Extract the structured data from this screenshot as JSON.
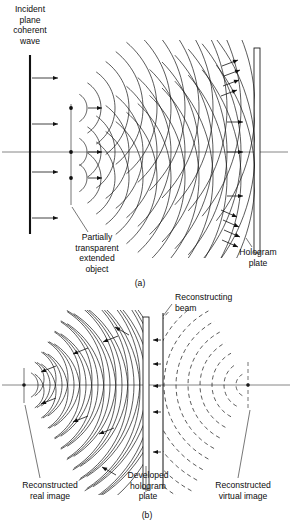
{
  "figure": {
    "title_visible": false,
    "width": 294,
    "height": 528,
    "background": "#ffffff",
    "ink": "#111111"
  },
  "panel_a": {
    "id_label": "(a)",
    "id_pos": {
      "x": 140,
      "y": 286
    },
    "labels": {
      "incident_wave": {
        "lines": [
          "Incident",
          "plane",
          "coherent",
          "wave"
        ],
        "x": 30,
        "y": 12,
        "align": "middle"
      },
      "object": {
        "lines": [
          "Partially",
          "transparent",
          "extended",
          "object"
        ],
        "x": 97,
        "y": 240,
        "align": "middle"
      },
      "hologram_plate": {
        "lines": [
          "Hologram",
          "plate"
        ],
        "x": 258,
        "y": 255,
        "align": "middle"
      }
    },
    "incident_beam": {
      "x": 30,
      "y_top": 55,
      "y_bottom": 234,
      "arrow_y": [
        78,
        124,
        172,
        218
      ],
      "arrow_len": 26
    },
    "optical_axis": {
      "x1": 2,
      "x2": 288,
      "y": 152
    },
    "object_line": {
      "x": 71,
      "y_top": 104,
      "y_bottom": 205
    },
    "object_points": [
      {
        "x": 71,
        "y": 108
      },
      {
        "x": 71,
        "y": 152
      },
      {
        "x": 71,
        "y": 178
      }
    ],
    "hologram_plate_rect": {
      "x": 254,
      "y": 48,
      "w": 6,
      "h": 205
    },
    "wavefront_count_per_source": 13,
    "wave_spacing": 14,
    "wave_start_radius": 16,
    "propagation_arrows": 14,
    "leader_object": {
      "x1": 88,
      "y1": 232,
      "x2": 72,
      "y2": 207
    },
    "leader_plate": {
      "x1": 252,
      "y1": 247,
      "x2": 246,
      "y2": 238
    }
  },
  "panel_b": {
    "id_label": "(b)",
    "id_pos": {
      "x": 147,
      "y": 518
    },
    "labels": {
      "reconstructing_beam": {
        "lines": [
          "Reconstructing",
          "beam"
        ],
        "x": 175,
        "y": 300,
        "align": "start"
      },
      "real_image": {
        "lines": [
          "Reconstructed",
          "real image"
        ],
        "x": 50,
        "y": 488,
        "align": "middle"
      },
      "developed_plate": {
        "lines": [
          "Developed",
          "hologram",
          "plate"
        ],
        "x": 148,
        "y": 478,
        "align": "middle"
      },
      "virtual_image": {
        "lines": [
          "Reconstructed",
          "virtual image"
        ],
        "x": 243,
        "y": 488,
        "align": "middle"
      }
    },
    "optical_axis": {
      "x1": 2,
      "x2": 290,
      "y": 385
    },
    "hologram_plate_rect": {
      "x": 143,
      "y": 317,
      "w": 6,
      "h": 172
    },
    "reconstructing_beam_line": {
      "x": 163,
      "y_top": 313,
      "y_bottom": 489
    },
    "real_image_point": {
      "x": 24,
      "y": 385
    },
    "real_image_marker": {
      "x": 24,
      "y_top": 368,
      "y_bottom": 403
    },
    "virtual_image_point": {
      "x": 248,
      "y": 385
    },
    "virtual_image_marker": {
      "x": 248,
      "y_top": 362,
      "y_bottom": 408
    },
    "converging_wave_count": 11,
    "diverging_wave_count": 11,
    "wave_spacing": 12,
    "beam_arrows_y": [
      340,
      364,
      386,
      412,
      452
    ],
    "leader_beam": {
      "x1": 172,
      "y1": 304,
      "x2": 163,
      "y2": 316
    },
    "leader_real": {
      "x1": 40,
      "y1": 478,
      "x2": 25,
      "y2": 405
    },
    "leader_plate": {
      "x1": 146,
      "y1": 466,
      "x2": 146,
      "y2": 492
    },
    "leader_virtual": {
      "x1": 238,
      "y1": 478,
      "x2": 250,
      "y2": 410
    }
  }
}
